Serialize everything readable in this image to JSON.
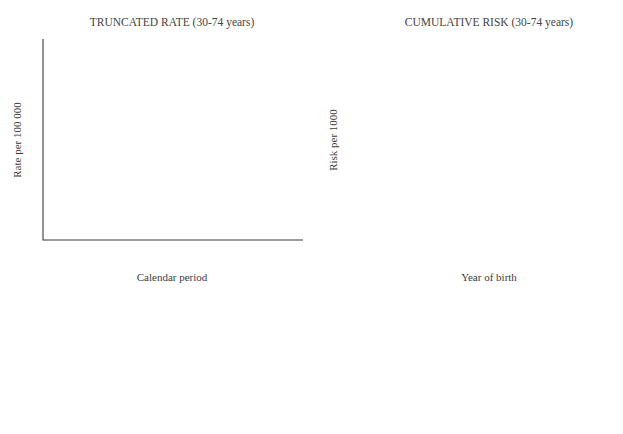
{
  "figure": {
    "background": "#ffffff",
    "line_color_default": "#8a8a8a",
    "highlight_color": "#1a1a1a"
  },
  "chart_data": [
    {
      "type": "line",
      "title": "TRUNCATED RATE (30-74 years)",
      "xlabel": "Calendar period",
      "ylabel": "Rate per 100 000",
      "xlim": [
        1957,
        1987
      ],
      "ylim": [
        5,
        21
      ],
      "yscale": "log",
      "grid": false,
      "legend_position": "bottom",
      "xticks": [
        1960,
        1965,
        1970,
        1975,
        1980,
        1985
      ],
      "xticks_minor_step": 1,
      "yticks": [
        5,
        10,
        21
      ],
      "yticks_minor": [
        6,
        7,
        8,
        9,
        11,
        12,
        13,
        14,
        15,
        16,
        17,
        18,
        19,
        20
      ],
      "series": [
        {
          "name": "FRANCE",
          "style": "solid",
          "color": "#8a8a8a",
          "x": [
            1957,
            1963,
            1970,
            1978,
            1985,
            1987
          ],
          "y": [
            15.4,
            15.9,
            16.7,
            17.4,
            18.1,
            18.2
          ]
        },
        {
          "name": "GREECE",
          "style": "dashed",
          "color": "#8a8a8a",
          "x": [
            1963,
            1968,
            1973,
            1978,
            1982,
            1987
          ],
          "y": [
            6.1,
            6.7,
            7.4,
            8.0,
            8.5,
            9.0
          ]
        },
        {
          "name": "ITALY",
          "style": "dashdot",
          "color": "#8a8a8a",
          "x": [
            1957,
            1962,
            1968,
            1974,
            1980,
            1987
          ],
          "y": [
            12.0,
            12.7,
            13.5,
            14.3,
            15.0,
            15.9
          ]
        },
        {
          "name": "PORTUGAL",
          "style": "dashdotdot",
          "color": "#8a8a8a",
          "x": [
            1957,
            1963,
            1970,
            1977,
            1982,
            1987
          ],
          "y": [
            11.6,
            11.4,
            11.4,
            11.4,
            11.6,
            11.7
          ]
        },
        {
          "name": "SPAIN",
          "style": "dotted",
          "color": "#8a8a8a",
          "x": [
            1957,
            1962,
            1968,
            1973,
            1978,
            1983,
            1987
          ],
          "y": [
            9.6,
            11.4,
            12.3,
            12.9,
            12.7,
            12.3,
            12.2
          ]
        },
        {
          "name": "BELGIUM",
          "style": "solid",
          "color": "#8a8a8a",
          "x": [
            1957,
            1962,
            1968,
            1974,
            1980,
            1987
          ],
          "y": [
            10.5,
            11.6,
            13.0,
            14.3,
            15.4,
            16.6
          ]
        },
        {
          "name": "GERMANY (FRG)",
          "style": "dashed-short",
          "color": "#8a8a8a",
          "x": [
            1957,
            1963,
            1969,
            1974,
            1979,
            1983,
            1987
          ],
          "y": [
            13.8,
            14.2,
            14.8,
            15.4,
            16.1,
            16.6,
            16.8
          ]
        },
        {
          "name": "NETHERLANDS",
          "style": "dashdot-long",
          "color": "#8a8a8a",
          "x": [
            1957,
            1963,
            1969,
            1975,
            1980,
            1987
          ],
          "y": [
            11.7,
            11.3,
            11.5,
            11.7,
            11.9,
            11.9
          ]
        },
        {
          "name": "IRELAND",
          "style": "dashdotdot-long",
          "color": "#8a8a8a",
          "x": [
            1957,
            1963,
            1969,
            1975,
            1981,
            1987
          ],
          "y": [
            13.0,
            13.2,
            13.4,
            13.6,
            13.7,
            13.8
          ]
        },
        {
          "name": "UK ENGLAND & WALES",
          "style": "solid",
          "color": "#8a8a8a",
          "x": [
            1957,
            1963,
            1968,
            1972,
            1978,
            1983,
            1987
          ],
          "y": [
            15.2,
            15.3,
            14.8,
            14.7,
            15.0,
            15.6,
            16.0
          ]
        },
        {
          "name": "UK SCOTLAND",
          "style": "dashed-med",
          "color": "#8a8a8a",
          "x": [
            1957,
            1962,
            1967,
            1972,
            1978,
            1983,
            1987
          ],
          "y": [
            12.6,
            11.6,
            10.6,
            10.7,
            10.5,
            11.5,
            12.1
          ]
        },
        {
          "name": "DENMARK",
          "style": "solid-bold",
          "color": "#1a1a1a",
          "x": [
            1957,
            1963,
            1968,
            1972,
            1977,
            1982,
            1987
          ],
          "y": [
            15.4,
            15.3,
            14.5,
            14.5,
            16.5,
            19.7,
            20.5
          ]
        }
      ]
    },
    {
      "type": "line",
      "title": "CUMULATIVE RISK (30-74 years)",
      "xlabel": "Year of birth",
      "ylabel": "Risk per 1000",
      "xlim": [
        1900,
        1937
      ],
      "ylim": [
        5,
        30
      ],
      "yscale": "log",
      "grid": false,
      "legend_position": "bottom",
      "xticks": [
        1900,
        1910,
        1920,
        1930
      ],
      "xticks_minor_step": 1,
      "yticks": [
        5,
        10,
        30
      ],
      "yticks_minor": [
        6,
        7,
        8,
        9,
        15,
        20,
        25
      ],
      "series": [
        {
          "name": "FRANCE",
          "style": "solid",
          "color": "#8a8a8a",
          "x": [
            1900,
            1912,
            1924,
            1937
          ],
          "y": [
            13.0,
            14.3,
            15.6,
            17.3
          ]
        },
        {
          "name": "GREECE",
          "style": "dashed",
          "color": "#8a8a8a",
          "x": [
            1905,
            1912,
            1920,
            1928,
            1934,
            1937
          ],
          "y": [
            6.2,
            6.8,
            7.3,
            7.5,
            7.9,
            8.4
          ]
        },
        {
          "name": "ITALY",
          "style": "dashdot",
          "color": "#8a8a8a",
          "x": [
            1900,
            1910,
            1920,
            1930,
            1937
          ],
          "y": [
            11.7,
            12.3,
            12.8,
            13.2,
            14.6
          ]
        },
        {
          "name": "PORTUGAL",
          "style": "dashdotdot",
          "color": "#8a8a8a",
          "x": [
            1900,
            1910,
            1920,
            1928,
            1933,
            1937
          ],
          "y": [
            11.1,
            11.6,
            12.1,
            12.4,
            12.6,
            13.1
          ]
        },
        {
          "name": "SPAIN",
          "style": "dotted",
          "color": "#8a8a8a",
          "x": [
            1900,
            1910,
            1918,
            1926,
            1932,
            1937
          ],
          "y": [
            10.4,
            10.6,
            10.7,
            10.6,
            10.8,
            12.2
          ]
        },
        {
          "name": "BELGIUM",
          "style": "solid",
          "color": "#8a8a8a",
          "x": [
            1900,
            1905,
            1912,
            1920,
            1928,
            1933,
            1937
          ],
          "y": [
            8.4,
            8.4,
            9.3,
            10.5,
            12.0,
            13.3,
            14.9
          ]
        },
        {
          "name": "GERMANY (FRG)",
          "style": "dashed-short",
          "color": "#8a8a8a",
          "x": [
            1900,
            1910,
            1920,
            1930,
            1937
          ],
          "y": [
            12.2,
            13.1,
            14.0,
            15.2,
            16.8
          ]
        },
        {
          "name": "NETHERLANDS",
          "style": "dashdot-long",
          "color": "#8a8a8a",
          "x": [
            1900,
            1910,
            1920,
            1930,
            1937
          ],
          "y": [
            12.6,
            13.1,
            13.8,
            15.0,
            17.2
          ]
        },
        {
          "name": "IRELAND",
          "style": "dashdotdot-long",
          "color": "#8a8a8a",
          "x": [
            1900,
            1912,
            1922,
            1930,
            1937
          ],
          "y": [
            10.0,
            10.2,
            10.1,
            9.3,
            7.8
          ]
        },
        {
          "name": "UK ENGLAND & WALES",
          "style": "solid",
          "color": "#8a8a8a",
          "x": [
            1900,
            1912,
            1924,
            1937
          ],
          "y": [
            14.0,
            14.8,
            15.8,
            17.0
          ]
        },
        {
          "name": "UK SCOTLAND",
          "style": "dashed-med",
          "color": "#8a8a8a",
          "x": [
            1900,
            1912,
            1924,
            1934,
            1937
          ],
          "y": [
            12.3,
            12.7,
            13.1,
            13.3,
            13.4
          ]
        },
        {
          "name": "DENMARK",
          "style": "solid-bold",
          "color": "#1a1a1a",
          "x": [
            1900,
            1908,
            1915,
            1922,
            1929,
            1937
          ],
          "y": [
            12.6,
            13.4,
            15.2,
            17.9,
            21.4,
            26.8
          ]
        }
      ]
    }
  ],
  "legend": {
    "columns": [
      [
        {
          "label": "FRANCE",
          "style": "solid",
          "bold": false
        },
        {
          "label": "GREECE",
          "style": "dashed",
          "bold": false
        },
        {
          "label": "ITALY",
          "style": "dashdot",
          "bold": false
        },
        {
          "label": "PORTUGAL",
          "style": "dashdotdot",
          "bold": false
        },
        {
          "label": "SPAIN",
          "style": "dotted",
          "bold": false
        },
        {
          "label": "BELGIUM",
          "style": "solid",
          "bold": false
        }
      ],
      [
        {
          "label": "GERMANY (FRG)",
          "style": "dashed-short",
          "bold": false
        },
        {
          "label": "NETHERLANDS",
          "style": "dashdot-long",
          "bold": false
        },
        {
          "label": "IRELAND",
          "style": "dashdotdot-long",
          "bold": false
        },
        {
          "label": "UK ENGLAND & WALES",
          "style": "solid",
          "bold": false
        },
        {
          "label": "UK SCOTLAND",
          "style": "dashed-med",
          "bold": false
        },
        {
          "label": "DENMARK",
          "style": "solid-bold",
          "bold": true
        }
      ]
    ]
  }
}
